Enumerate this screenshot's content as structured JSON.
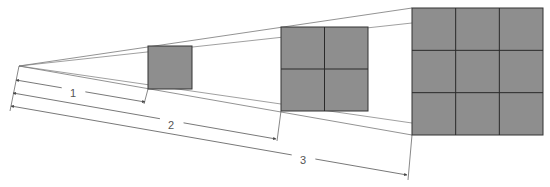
{
  "diagram": {
    "type": "inverse-square-law",
    "colors": {
      "square_fill": "#8e8e8e",
      "square_stroke": "#333333",
      "grid_line": "#2a2a2a",
      "projection_line": "#777777",
      "dimension_line": "#555555",
      "label": "#555555"
    },
    "apex": {
      "x": 19,
      "y": 66
    },
    "squares": [
      {
        "id": "square-1",
        "x": 148,
        "y": 46,
        "w": 44,
        "h": 43,
        "divisions": 1
      },
      {
        "id": "square-2",
        "x": 281,
        "y": 27,
        "w": 87,
        "h": 84,
        "divisions": 2
      },
      {
        "id": "square-3",
        "x": 412,
        "y": 8,
        "w": 131,
        "h": 127,
        "divisions": 3
      }
    ],
    "dimensions": [
      {
        "label": "1",
        "start": {
          "x": 16,
          "y": 80
        },
        "end": {
          "x": 145,
          "y": 102
        },
        "label_pos": {
          "x": 73,
          "y": 93
        }
      },
      {
        "label": "2",
        "start": {
          "x": 13,
          "y": 93
        },
        "end": {
          "x": 276,
          "y": 139
        },
        "label_pos": {
          "x": 171,
          "y": 125
        }
      },
      {
        "label": "3",
        "start": {
          "x": 11,
          "y": 106
        },
        "end": {
          "x": 407,
          "y": 175
        },
        "label_pos": {
          "x": 303,
          "y": 160
        }
      }
    ]
  }
}
